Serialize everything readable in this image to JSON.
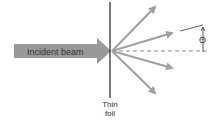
{
  "diagram": {
    "beam_label": "Incident beam",
    "foil_label_line1": "Thin",
    "foil_label_line2": "foil",
    "angle_symbol": "Θ",
    "colors": {
      "beam_fill": "#999999",
      "arrow": "#a0a0a0",
      "line": "#222222",
      "dash": "#8a8a8a"
    },
    "scattered_rays": 4
  }
}
